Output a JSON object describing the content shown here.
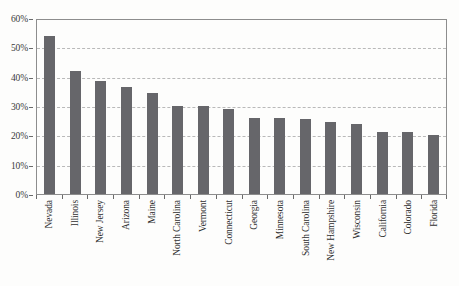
{
  "chart_data": {
    "type": "bar",
    "title": "",
    "subtitle": "",
    "xlabel": "",
    "ylabel": "",
    "categories": [
      "Nevada",
      "Illinois",
      "New Jersey",
      "Arizona",
      "Maine",
      "North Carolina",
      "Vermont",
      "Connecticut",
      "Georgia",
      "Minnesota",
      "South Carolina",
      "New Hampshire",
      "Wisconsin",
      "California",
      "Colorado",
      "Florida"
    ],
    "values": [
      54,
      42,
      38.5,
      36.5,
      34.5,
      30,
      30,
      29,
      26,
      26,
      25.5,
      24.5,
      24,
      21,
      21,
      20
    ],
    "ylim": [
      0,
      60
    ],
    "ytick_values": [
      0,
      10,
      20,
      30,
      40,
      50,
      60
    ],
    "ytick_labels": [
      "0%",
      "10%",
      "20%",
      "30%",
      "40%",
      "50%",
      "60%"
    ],
    "grid": true,
    "grid_axis": "y",
    "grid_style": "dashed",
    "legend": null,
    "legend_position": "none",
    "bar_color": "#66666a",
    "grid_color": "#b9b9b9",
    "axis_color": "#8d8d8d",
    "plot_background": "#fdfdfc",
    "label_rotation": 90,
    "annotations": []
  }
}
